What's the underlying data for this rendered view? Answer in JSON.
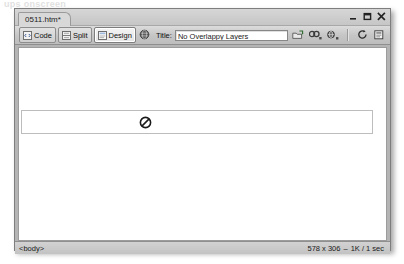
{
  "page": {
    "top_caption": "ups onscreen"
  },
  "window": {
    "tab_title": "0511.htm*",
    "controls": [
      {
        "name": "minimize",
        "label": "–"
      },
      {
        "name": "restore",
        "label": "❐"
      },
      {
        "name": "close",
        "label": "×"
      }
    ]
  },
  "toolbar": {
    "view_buttons": [
      {
        "label": "Code",
        "icon": "code-view-icon",
        "active": false
      },
      {
        "label": "Split",
        "icon": "split-view-icon",
        "active": false
      },
      {
        "label": "Design",
        "icon": "design-view-icon",
        "active": true
      }
    ],
    "live_view_icon": "globe-icon",
    "title_label": "Title:",
    "title_value": "No Overlappy Layers",
    "title_placeholder": "Untitled Document",
    "right_icons": [
      {
        "name": "file-management-icon"
      },
      {
        "name": "preview-in-browser-icon"
      },
      {
        "name": "refresh-design-view-icon"
      },
      {
        "name": "view-options-icon"
      },
      {
        "name": "visual-aids-icon"
      },
      {
        "name": "validate-markup-icon"
      },
      {
        "name": "check-browser-compatibility-icon"
      }
    ]
  },
  "canvas": {
    "layer": {
      "name": "apDiv-layer",
      "icon": "no-entry-icon"
    }
  },
  "statusbar": {
    "tag_selector": "<body>",
    "window_size": "578 x 306",
    "separator": "–",
    "document_size": "1K / 1 sec"
  },
  "colors": {
    "window_chrome": "#cccccc",
    "toolbar_top": "#dcdcdc",
    "toolbar_bottom": "#bdbdbd",
    "canvas_bg": "#b4b4b4",
    "page_white": "#ffffff",
    "layer_border": "#bdbdbd",
    "text": "#1a1a1a"
  }
}
